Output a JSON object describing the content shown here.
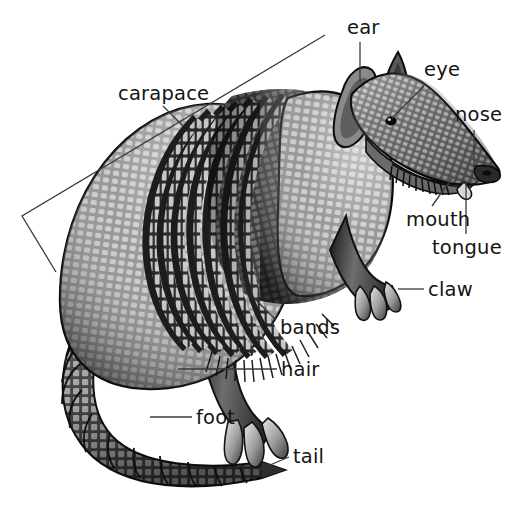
{
  "diagram": {
    "view": "lateral",
    "style": "black-and-white scientific illustration",
    "background_color": "#ffffff",
    "label_color": "#141414",
    "leader_line_color": "#3a3a3a",
    "canvas": {
      "width": 513,
      "height": 508
    }
  },
  "labels": [
    {
      "id": "carapace",
      "text": "carapace",
      "x": 118,
      "y": 84,
      "anchor": "start",
      "connector": "bracket",
      "leader": {
        "x1": 163,
        "y1": 106,
        "x2": 183,
        "y2": 126
      }
    },
    {
      "id": "ear",
      "text": "ear",
      "x": 347,
      "y": 18,
      "anchor": "start",
      "connector": "line",
      "leader": {
        "x1": 360,
        "y1": 42,
        "x2": 360,
        "y2": 82
      }
    },
    {
      "id": "eye",
      "text": "eye",
      "x": 424,
      "y": 60,
      "anchor": "start",
      "connector": "line",
      "leader": {
        "x1": 424,
        "y1": 86,
        "x2": 392,
        "y2": 118
      }
    },
    {
      "id": "nose",
      "text": "nose",
      "x": 455,
      "y": 105,
      "anchor": "start",
      "connector": "line",
      "leader": {
        "x1": 474,
        "y1": 130,
        "x2": 474,
        "y2": 168
      }
    },
    {
      "id": "mouth",
      "text": "mouth",
      "x": 406,
      "y": 210,
      "anchor": "start",
      "connector": "line",
      "leader": {
        "x1": 432,
        "y1": 206,
        "x2": 452,
        "y2": 178
      }
    },
    {
      "id": "tongue",
      "text": "tongue",
      "x": 432,
      "y": 238,
      "anchor": "start",
      "connector": "line",
      "leader": {
        "x1": 466,
        "y1": 234,
        "x2": 466,
        "y2": 183
      }
    },
    {
      "id": "claw",
      "text": "claw",
      "x": 428,
      "y": 280,
      "anchor": "start",
      "connector": "line",
      "leader": {
        "x1": 424,
        "y1": 289,
        "x2": 398,
        "y2": 289
      }
    },
    {
      "id": "bands",
      "text": "bands",
      "x": 280,
      "y": 318,
      "anchor": "start",
      "connector": "line",
      "leader": {
        "x1": 276,
        "y1": 320,
        "x2": 254,
        "y2": 298
      }
    },
    {
      "id": "hair",
      "text": "hair",
      "x": 281,
      "y": 360,
      "anchor": "start",
      "connector": "line",
      "leader": {
        "x1": 277,
        "y1": 369,
        "x2": 178,
        "y2": 369
      }
    },
    {
      "id": "foot",
      "text": "foot",
      "x": 196,
      "y": 408,
      "anchor": "start",
      "connector": "line",
      "leader": {
        "x1": 192,
        "y1": 417,
        "x2": 150,
        "y2": 417
      }
    },
    {
      "id": "tail",
      "text": "tail",
      "x": 293,
      "y": 447,
      "anchor": "start",
      "connector": "line",
      "leader": {
        "x1": 289,
        "y1": 457,
        "x2": 258,
        "y2": 470
      }
    }
  ],
  "bracket": {
    "id": "carapace-bracket",
    "points": "325,35 22,216 56,272",
    "note": "V-shaped bracket spanning the dorsal shell"
  },
  "anatomy_parts": [
    "carapace",
    "ear",
    "eye",
    "nose",
    "mouth",
    "tongue",
    "claw",
    "bands",
    "hair",
    "foot",
    "tail"
  ]
}
